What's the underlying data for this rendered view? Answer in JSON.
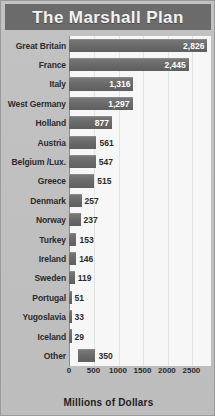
{
  "chart_data": {
    "type": "bar",
    "orientation": "horizontal",
    "title": "The Marshall Plan",
    "xlabel": "Millions of Dollars",
    "ylabel": "",
    "xlim": [
      0,
      2900
    ],
    "xticks": [
      0,
      500,
      1000,
      1500,
      2000,
      2500
    ],
    "xtick_labels": [
      "0",
      "500",
      "1000",
      "1500",
      "2000",
      "2500"
    ],
    "grid": true,
    "grid_axis": "x",
    "legend": false,
    "categories": [
      "Great Britain",
      "France",
      "Italy",
      "West Germany",
      "Holland",
      "Austria",
      "Belgium /Lux.",
      "Greece",
      "Denmark",
      "Norway",
      "Turkey",
      "Ireland",
      "Sweden",
      "Portugal",
      "Yugoslavia",
      "Iceland",
      "Other"
    ],
    "values": [
      2826,
      2445,
      1316,
      1297,
      877,
      561,
      547,
      515,
      257,
      237,
      153,
      146,
      119,
      51,
      33,
      29,
      350
    ],
    "value_labels": [
      "2,826",
      "2,445",
      "1,316",
      "1,297",
      "877",
      "561",
      "547",
      "515",
      "257",
      "237",
      "153",
      "146",
      "119",
      "51",
      "33",
      "29",
      "350"
    ],
    "bars": [
      {
        "label": "Great Britain",
        "value": 2826,
        "display": "2,826",
        "label_position": "inside"
      },
      {
        "label": "France",
        "value": 2445,
        "display": "2,445",
        "label_position": "inside"
      },
      {
        "label": "Italy",
        "value": 1316,
        "display": "1,316",
        "label_position": "inside"
      },
      {
        "label": "West Germany",
        "value": 1297,
        "display": "1,297",
        "label_position": "inside"
      },
      {
        "label": "Holland",
        "value": 877,
        "display": "877",
        "label_position": "inside"
      },
      {
        "label": "Austria",
        "value": 561,
        "display": "561",
        "label_position": "outside"
      },
      {
        "label": "Belgium /Lux.",
        "value": 547,
        "display": "547",
        "label_position": "outside"
      },
      {
        "label": "Greece",
        "value": 515,
        "display": "515",
        "label_position": "outside"
      },
      {
        "label": "Denmark",
        "value": 257,
        "display": "257",
        "label_position": "outside"
      },
      {
        "label": "Norway",
        "value": 237,
        "display": "237",
        "label_position": "outside"
      },
      {
        "label": "Turkey",
        "value": 153,
        "display": "153",
        "label_position": "outside"
      },
      {
        "label": "Ireland",
        "value": 146,
        "display": "146",
        "label_position": "outside"
      },
      {
        "label": "Sweden",
        "value": 119,
        "display": "119",
        "label_position": "outside"
      },
      {
        "label": "Portugal",
        "value": 51,
        "display": "51",
        "label_position": "outside"
      },
      {
        "label": "Yugoslavia",
        "value": 33,
        "display": "33",
        "label_position": "outside"
      },
      {
        "label": "Iceland",
        "value": 29,
        "display": "29",
        "label_position": "outside"
      },
      {
        "label": "Other",
        "value": 350,
        "display": "350",
        "label_position": "outside",
        "offset": 190
      }
    ],
    "colors": {
      "bar": "#6a6a6a",
      "title_band": "#6b6b6b",
      "title_text": "#f2f2f2",
      "plot_background": "#f7f7f7",
      "figure_background": "#c0c0c0",
      "gridline": "#e3e3e3",
      "text": "#2b2b2b",
      "value_inside": "#ffffff"
    }
  }
}
